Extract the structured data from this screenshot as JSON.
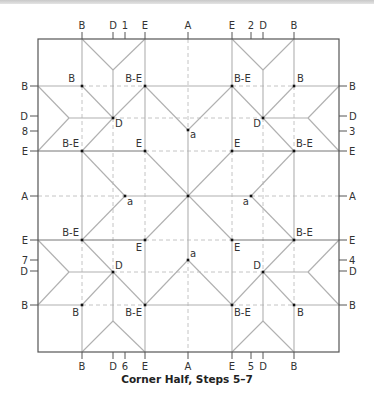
{
  "caption": "Corner Half, Steps 5–7",
  "colors": {
    "border": "#555555",
    "crease_solid": "#b0b0b0",
    "crease_dark": "#777777",
    "crease_dashed": "#c4c4c4",
    "point": "#111111",
    "label": "#333333"
  },
  "square": {
    "left": 38,
    "top": 39,
    "right": 339,
    "bottom": 352
  },
  "top_ticks": [
    {
      "label": "B",
      "x": 82
    },
    {
      "label": "D",
      "x": 113
    },
    {
      "label": "1",
      "x": 125
    },
    {
      "label": "E",
      "x": 145
    },
    {
      "label": "A",
      "x": 188
    },
    {
      "label": "E",
      "x": 232
    },
    {
      "label": "2",
      "x": 251
    },
    {
      "label": "D",
      "x": 263
    },
    {
      "label": "B",
      "x": 294
    }
  ],
  "bottom_ticks": [
    {
      "label": "B",
      "x": 82
    },
    {
      "label": "D",
      "x": 113
    },
    {
      "label": "6",
      "x": 125
    },
    {
      "label": "E",
      "x": 145
    },
    {
      "label": "A",
      "x": 188
    },
    {
      "label": "E",
      "x": 232
    },
    {
      "label": "5",
      "x": 251
    },
    {
      "label": "D",
      "x": 263
    },
    {
      "label": "B",
      "x": 294
    }
  ],
  "left_ticks": [
    {
      "label": "B",
      "y": 86
    },
    {
      "label": "D",
      "y": 116
    },
    {
      "label": "8",
      "y": 131
    },
    {
      "label": "E",
      "y": 151
    },
    {
      "label": "A",
      "y": 196
    },
    {
      "label": "E",
      "y": 240
    },
    {
      "label": "7",
      "y": 260
    },
    {
      "label": "D",
      "y": 271
    },
    {
      "label": "B",
      "y": 305
    }
  ],
  "right_ticks": [
    {
      "label": "B",
      "y": 86
    },
    {
      "label": "D",
      "y": 116
    },
    {
      "label": "3",
      "y": 131
    },
    {
      "label": "E",
      "y": 151
    },
    {
      "label": "A",
      "y": 196
    },
    {
      "label": "E",
      "y": 240
    },
    {
      "label": "4",
      "y": 260
    },
    {
      "label": "D",
      "y": 271
    },
    {
      "label": "B",
      "y": 305
    }
  ],
  "points": [
    {
      "label": "B",
      "x": 82,
      "y": 86,
      "lx": -7,
      "ly": -4,
      "anchor": "end"
    },
    {
      "label": "B-E",
      "x": 145,
      "y": 86,
      "lx": -3,
      "ly": -4,
      "anchor": "end"
    },
    {
      "label": "B-E",
      "x": 232,
      "y": 86,
      "lx": 2,
      "ly": -4,
      "anchor": "start"
    },
    {
      "label": "B",
      "x": 294,
      "y": 86,
      "lx": 3,
      "ly": -4,
      "anchor": "start"
    },
    {
      "label": "D",
      "x": 113,
      "y": 118,
      "lx": 2,
      "ly": 9,
      "anchor": "start"
    },
    {
      "label": "D",
      "x": 263,
      "y": 118,
      "lx": -2,
      "ly": 9,
      "anchor": "end"
    },
    {
      "label": "a",
      "x": 188,
      "y": 130,
      "lx": 2,
      "ly": 8,
      "anchor": "start"
    },
    {
      "label": "B-E",
      "x": 82,
      "y": 151,
      "lx": -3,
      "ly": -4,
      "anchor": "end"
    },
    {
      "label": "E",
      "x": 145,
      "y": 151,
      "lx": -3,
      "ly": -4,
      "anchor": "end"
    },
    {
      "label": "E",
      "x": 232,
      "y": 151,
      "lx": 2,
      "ly": -4,
      "anchor": "start"
    },
    {
      "label": "B-E",
      "x": 294,
      "y": 151,
      "lx": 2,
      "ly": -4,
      "anchor": "start"
    },
    {
      "label": "a",
      "x": 125,
      "y": 196,
      "lx": 2,
      "ly": 9,
      "anchor": "start"
    },
    {
      "label": "",
      "x": 188,
      "y": 196,
      "lx": 0,
      "ly": 0,
      "anchor": "start"
    },
    {
      "label": "a",
      "x": 251,
      "y": 196,
      "lx": -2,
      "ly": 9,
      "anchor": "end"
    },
    {
      "label": "B-E",
      "x": 82,
      "y": 240,
      "lx": -3,
      "ly": -4,
      "anchor": "end"
    },
    {
      "label": "E",
      "x": 145,
      "y": 240,
      "lx": -3,
      "ly": 11,
      "anchor": "end"
    },
    {
      "label": "E",
      "x": 232,
      "y": 240,
      "lx": 2,
      "ly": 11,
      "anchor": "start"
    },
    {
      "label": "B-E",
      "x": 294,
      "y": 240,
      "lx": 2,
      "ly": -4,
      "anchor": "start"
    },
    {
      "label": "a",
      "x": 188,
      "y": 260,
      "lx": 2,
      "ly": -3,
      "anchor": "start"
    },
    {
      "label": "D",
      "x": 113,
      "y": 272,
      "lx": 2,
      "ly": -3,
      "anchor": "start"
    },
    {
      "label": "D",
      "x": 263,
      "y": 272,
      "lx": -2,
      "ly": -3,
      "anchor": "end"
    },
    {
      "label": "B",
      "x": 82,
      "y": 305,
      "lx": -3,
      "ly": 11,
      "anchor": "end"
    },
    {
      "label": "B-E",
      "x": 145,
      "y": 305,
      "lx": -3,
      "ly": 11,
      "anchor": "end"
    },
    {
      "label": "B-E",
      "x": 232,
      "y": 305,
      "lx": 2,
      "ly": 11,
      "anchor": "start"
    },
    {
      "label": "B",
      "x": 294,
      "y": 305,
      "lx": 3,
      "ly": 11,
      "anchor": "start"
    }
  ],
  "solid_lines": [
    [
      82,
      39,
      82,
      86
    ],
    [
      145,
      39,
      145,
      151
    ],
    [
      232,
      39,
      232,
      151
    ],
    [
      294,
      39,
      294,
      86
    ],
    [
      113,
      70,
      113,
      118
    ],
    [
      263,
      70,
      263,
      118
    ],
    [
      82,
      39,
      113,
      70
    ],
    [
      113,
      70,
      145,
      39
    ],
    [
      232,
      39,
      263,
      70
    ],
    [
      263,
      70,
      294,
      39
    ],
    [
      38,
      86,
      82,
      86
    ],
    [
      145,
      86,
      232,
      86
    ],
    [
      294,
      86,
      339,
      86
    ],
    [
      38,
      86,
      69,
      118
    ],
    [
      69,
      118,
      38,
      151
    ],
    [
      339,
      86,
      308,
      118
    ],
    [
      308,
      118,
      339,
      151
    ],
    [
      69,
      118,
      113,
      118
    ],
    [
      263,
      118,
      308,
      118
    ],
    [
      82,
      86,
      113,
      118
    ],
    [
      113,
      118,
      145,
      86
    ],
    [
      113,
      118,
      82,
      151
    ],
    [
      294,
      86,
      263,
      118
    ],
    [
      263,
      118,
      232,
      86
    ],
    [
      263,
      118,
      294,
      151
    ],
    [
      145,
      86,
      188,
      130
    ],
    [
      188,
      130,
      232,
      86
    ],
    [
      82,
      151,
      125,
      196
    ],
    [
      125,
      196,
      82,
      240
    ],
    [
      294,
      151,
      251,
      196
    ],
    [
      251,
      196,
      294,
      240
    ],
    [
      82,
      151,
      82,
      240
    ],
    [
      294,
      151,
      294,
      240
    ],
    [
      188,
      130,
      188,
      260
    ],
    [
      125,
      196,
      251,
      196
    ],
    [
      145,
      151,
      232,
      240
    ],
    [
      232,
      151,
      145,
      240
    ],
    [
      82,
      305,
      82,
      352
    ],
    [
      145,
      240,
      145,
      352
    ],
    [
      232,
      240,
      232,
      352
    ],
    [
      294,
      305,
      294,
      352
    ],
    [
      113,
      272,
      113,
      321
    ],
    [
      263,
      272,
      263,
      321
    ],
    [
      82,
      352,
      113,
      321
    ],
    [
      113,
      321,
      145,
      352
    ],
    [
      232,
      352,
      263,
      321
    ],
    [
      263,
      321,
      294,
      352
    ],
    [
      38,
      305,
      82,
      305
    ],
    [
      145,
      305,
      232,
      305
    ],
    [
      294,
      305,
      339,
      305
    ],
    [
      38,
      305,
      69,
      272
    ],
    [
      69,
      272,
      38,
      240
    ],
    [
      339,
      305,
      308,
      272
    ],
    [
      308,
      272,
      339,
      240
    ],
    [
      69,
      272,
      113,
      272
    ],
    [
      263,
      272,
      308,
      272
    ],
    [
      82,
      305,
      113,
      272
    ],
    [
      113,
      272,
      145,
      305
    ],
    [
      113,
      272,
      82,
      240
    ],
    [
      294,
      305,
      263,
      272
    ],
    [
      263,
      272,
      232,
      305
    ],
    [
      263,
      272,
      294,
      240
    ],
    [
      145,
      305,
      188,
      260
    ],
    [
      188,
      260,
      232,
      305
    ]
  ],
  "dark_lines": [
    [
      38,
      151,
      145,
      151
    ],
    [
      232,
      151,
      339,
      151
    ],
    [
      38,
      240,
      145,
      240
    ],
    [
      232,
      240,
      339,
      240
    ]
  ],
  "dashed_lines": [
    [
      82,
      86,
      82,
      151
    ],
    [
      294,
      86,
      294,
      151
    ],
    [
      82,
      240,
      82,
      305
    ],
    [
      294,
      240,
      294,
      305
    ],
    [
      82,
      86,
      145,
      86
    ],
    [
      232,
      86,
      294,
      86
    ],
    [
      82,
      305,
      145,
      305
    ],
    [
      232,
      305,
      294,
      305
    ],
    [
      113,
      118,
      113,
      272
    ],
    [
      263,
      118,
      263,
      272
    ],
    [
      113,
      118,
      263,
      118
    ],
    [
      113,
      272,
      263,
      272
    ],
    [
      145,
      151,
      232,
      151
    ],
    [
      145,
      240,
      232,
      240
    ],
    [
      145,
      151,
      145,
      240
    ],
    [
      232,
      151,
      232,
      240
    ],
    [
      188,
      39,
      188,
      130
    ],
    [
      188,
      260,
      188,
      352
    ],
    [
      38,
      196,
      125,
      196
    ],
    [
      251,
      196,
      339,
      196
    ]
  ]
}
